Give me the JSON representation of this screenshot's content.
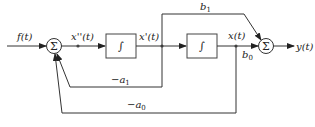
{
  "diagram": {
    "type": "signal-flow block diagram",
    "colors": {
      "line": "#333333",
      "background": "#ffffff"
    },
    "input": {
      "label": "f(t)"
    },
    "output": {
      "label": "y(t)"
    },
    "summers": [
      {
        "id": "sum1",
        "symbol": "Σ"
      },
      {
        "id": "sum2",
        "symbol": "Σ"
      }
    ],
    "integrators": [
      {
        "id": "int1",
        "symbol": "∫"
      },
      {
        "id": "int2",
        "symbol": "∫"
      }
    ],
    "signals": {
      "x2": "x''(t)",
      "x1": "x'(t)",
      "x0": "x(t)"
    },
    "gains": {
      "b1": "b",
      "b1_sub": "1",
      "b0": "b",
      "b0_sub": "0",
      "a1": "−a",
      "a1_sub": "1",
      "a0": "−a",
      "a0_sub": "0"
    }
  }
}
